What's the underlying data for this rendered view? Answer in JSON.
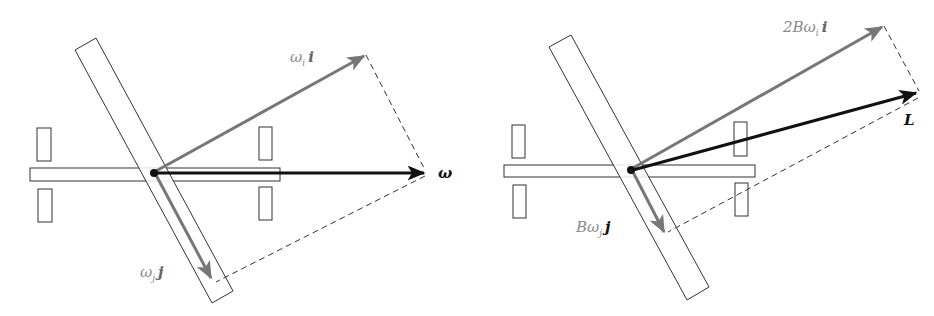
{
  "figure": {
    "left_panel": {
      "labels": {
        "omega_i_i": {
          "base": "ω",
          "sub": "i",
          "vec": "i"
        },
        "omega_j_j": {
          "base": "ω",
          "sub": "j",
          "vec": "j"
        },
        "omega": "ω"
      }
    },
    "right_panel": {
      "labels": {
        "two_b_omega_i_i": {
          "coef": "2B",
          "base": "ω",
          "sub": "i",
          "vec": "i"
        },
        "b_omega_j_j": {
          "coef": "B",
          "base": "ω",
          "sub": "j",
          "vec": "j"
        },
        "L": "L"
      }
    },
    "colors": {
      "component_arrow": "#777777",
      "resultant_arrow": "#111111",
      "outline": "#333333",
      "label_gray": "#8a8a8a"
    }
  }
}
